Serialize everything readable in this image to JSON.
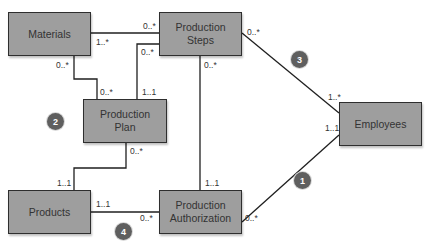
{
  "diagram": {
    "type": "UML class diagram",
    "entities": [
      {
        "id": "materials",
        "lines": [
          "Materials"
        ]
      },
      {
        "id": "production_steps",
        "lines": [
          "Production",
          "Steps"
        ]
      },
      {
        "id": "production_plan",
        "lines": [
          "Production",
          "Plan"
        ]
      },
      {
        "id": "employees",
        "lines": [
          "Employees"
        ]
      },
      {
        "id": "products",
        "lines": [
          "Products"
        ]
      },
      {
        "id": "production_authorization",
        "lines": [
          "Production",
          "Authorization"
        ]
      }
    ],
    "associations": [
      {
        "from": "materials",
        "to": "production_steps",
        "from_mult": "1..*",
        "to_mult": "0..*"
      },
      {
        "from": "materials",
        "to": "production_plan",
        "from_mult": "0..*",
        "to_mult": "0..*"
      },
      {
        "from": "production_steps",
        "to": "production_plan",
        "from_mult": "0..*",
        "to_mult": "1..1"
      },
      {
        "from": "production_steps",
        "to": "employees",
        "from_mult": "0..*",
        "to_mult": "1..*"
      },
      {
        "from": "production_steps",
        "to": "production_authorization",
        "from_mult": "0..*",
        "to_mult": "1..1"
      },
      {
        "from": "production_plan",
        "to": "products",
        "from_mult": "0..*",
        "to_mult": "1..1"
      },
      {
        "from": "products",
        "to": "production_authorization",
        "from_mult": "1..1",
        "to_mult": "0..*"
      },
      {
        "from": "production_authorization",
        "to": "employees",
        "from_mult": "0..*",
        "to_mult": "1..1"
      }
    ],
    "multiplicity_labels": {
      "mat_steps_mat": "1..*",
      "mat_steps_steps": "0..*",
      "steps_plan_steps": "0..*",
      "mat_plan_mat": "0..*",
      "mat_plan_plan": "0..*",
      "steps_plan_plan": "1..1",
      "steps_emp_steps": "0..*",
      "steps_emp_emp": "1..*",
      "steps_auth_steps": "0..*",
      "steps_auth_auth": "1..1",
      "plan_prod_plan": "0..*",
      "plan_prod_prod": "1..1",
      "prod_auth_prod": "1..1",
      "prod_auth_auth": "0..*",
      "auth_emp_auth": "0..*",
      "auth_emp_emp": "1..1"
    },
    "badges": [
      "1",
      "2",
      "3",
      "4"
    ]
  }
}
